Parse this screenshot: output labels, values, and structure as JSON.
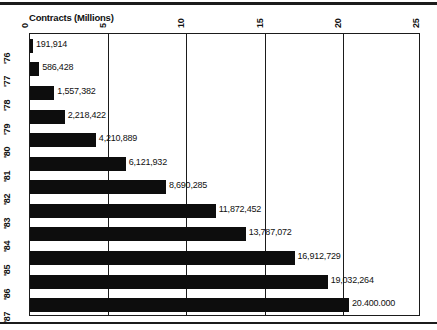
{
  "chart_data": {
    "type": "bar",
    "orientation": "horizontal",
    "title": "Contracts (Millions)",
    "xlabel": "",
    "ylabel": "",
    "xlim": [
      0,
      25
    ],
    "grid": true,
    "legend": null,
    "xticks": [
      "0",
      "5",
      "10",
      "15",
      "20",
      "25"
    ],
    "xtick_values": [
      0,
      5,
      10,
      15,
      20,
      25
    ],
    "categories": [
      "'76",
      "'77",
      "'78",
      "'79",
      "'80",
      "'81",
      "'82",
      "'83",
      "'84",
      "'85",
      "'86",
      "'87"
    ],
    "values": [
      191914,
      586428,
      1557382,
      2218422,
      4210889,
      6121932,
      8690285,
      11872452,
      13787072,
      16912729,
      19032264,
      20400000
    ],
    "value_labels": [
      "191,914",
      "586,428",
      "1,557,382",
      "2,218,422",
      "4,210,889",
      "6,121,932",
      "8,690,285",
      "11,872,452",
      "13,787,072",
      "16,912,729",
      "19,032,264",
      "20.400.000"
    ],
    "units": "millions",
    "bar_color": "#0d0d0d"
  }
}
